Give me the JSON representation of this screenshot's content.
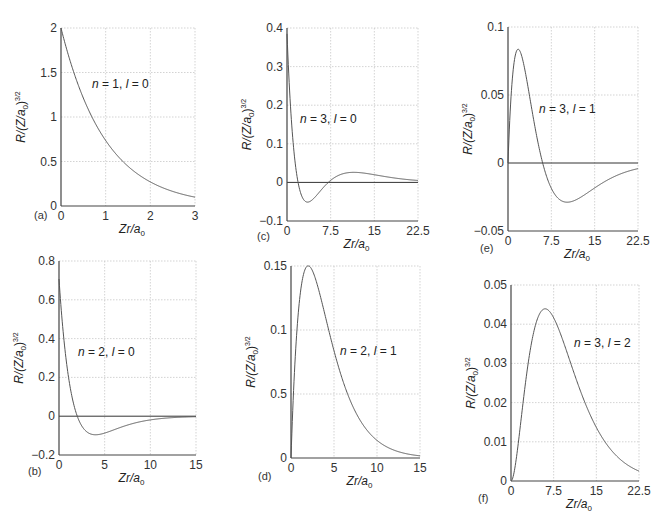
{
  "figure": {
    "ylabel_text": "R/(Z/a",
    "ylabel_sub": "0",
    "ylabel_sup": ")",
    "ylabel_exp": "3/2",
    "xlabel_text": "Zr/a",
    "xlabel_sub": "0"
  },
  "chart_data": [
    {
      "id": "a",
      "type": "line",
      "panel_label": "(a)",
      "annotation": "n = 1, l = 0",
      "n": 1,
      "l": 0,
      "xlabel": "Zr/a0",
      "ylabel": "R/(Z/a0)^(3/2)",
      "xlim": [
        0,
        3
      ],
      "ylim": [
        0,
        2
      ],
      "xticks": [
        "0",
        "1",
        "2",
        "3"
      ],
      "xtick_values": [
        0,
        1,
        2,
        3
      ],
      "yticks": [
        "0",
        "0.5",
        "1",
        "1.5",
        "2"
      ],
      "ytick_values": [
        0,
        0.5,
        1,
        1.5,
        2
      ],
      "grid": true,
      "series": [
        {
          "name": "R10",
          "x": [
            0,
            0.5,
            1,
            1.5,
            2,
            2.5,
            3
          ],
          "values": [
            2.0,
            1.21,
            0.74,
            0.45,
            0.27,
            0.16,
            0.1
          ]
        }
      ],
      "box": {
        "x0": 61,
        "y0": 28,
        "x1": 195,
        "y1": 206
      }
    },
    {
      "id": "b",
      "type": "line",
      "panel_label": "(b)",
      "annotation": "n = 2, l = 0",
      "n": 2,
      "l": 0,
      "xlabel": "Zr/a0",
      "ylabel": "R/(Z/a0)^(3/2)",
      "xlim": [
        0,
        15
      ],
      "ylim": [
        -0.2,
        0.8
      ],
      "xticks": [
        "0",
        "5",
        "10",
        "15"
      ],
      "xtick_values": [
        0,
        5,
        10,
        15
      ],
      "yticks": [
        "−0.2",
        "0",
        "0.2",
        "0.4",
        "0.6",
        "0.8"
      ],
      "ytick_values": [
        -0.2,
        0,
        0.2,
        0.4,
        0.6,
        0.8
      ],
      "grid": true,
      "series": [
        {
          "name": "R20",
          "x": [
            0,
            1,
            2,
            3,
            4,
            5,
            7.5,
            10,
            15
          ],
          "values": [
            0.707,
            0.214,
            0,
            -0.079,
            -0.096,
            -0.091,
            -0.057,
            -0.027,
            -0.003
          ]
        }
      ],
      "box": {
        "x0": 59,
        "y0": 261,
        "x1": 196,
        "y1": 455
      }
    },
    {
      "id": "c",
      "type": "line",
      "panel_label": "(c)",
      "annotation": "n = 3, l = 0",
      "n": 3,
      "l": 0,
      "xlabel": "Zr/a0",
      "ylabel": "R/(Z/a0)^(3/2)",
      "xlim": [
        0,
        22.5
      ],
      "ylim": [
        -0.1,
        0.4
      ],
      "xticks": [
        "0",
        "7.5",
        "15",
        "22.5"
      ],
      "xtick_values": [
        0,
        7.5,
        15,
        22.5
      ],
      "yticks": [
        "−0.1",
        "0",
        "0.1",
        "0.2",
        "0.3",
        "0.4"
      ],
      "ytick_values": [
        -0.1,
        0,
        0.1,
        0.2,
        0.3,
        0.4
      ],
      "grid": true,
      "series": [
        {
          "name": "R30",
          "x": [
            0,
            1.9,
            3.5,
            7.1,
            10.5,
            15,
            22.5
          ],
          "values": [
            0.385,
            0,
            -0.054,
            0,
            0.025,
            0.018,
            0.006
          ]
        }
      ],
      "box": {
        "x0": 287,
        "y0": 28,
        "x1": 418,
        "y1": 221
      }
    },
    {
      "id": "d",
      "type": "line",
      "panel_label": "(d)",
      "annotation": "n = 2, l = 1",
      "n": 2,
      "l": 1,
      "xlabel": "Zr/a0",
      "ylabel": "R/(Z/a0)^(3/2)",
      "xlim": [
        0,
        15
      ],
      "ylim": [
        0,
        0.15
      ],
      "xticks": [
        "0",
        "5",
        "10",
        "15"
      ],
      "xtick_values": [
        0,
        5,
        10,
        15
      ],
      "yticks": [
        "0",
        "0.5",
        "0.1",
        "0.15"
      ],
      "ytick_values": [
        0,
        0.05,
        0.1,
        0.15
      ],
      "grid": true,
      "series": [
        {
          "name": "R21",
          "x": [
            0,
            1,
            2,
            3,
            5,
            7.5,
            10,
            15
          ],
          "values": [
            0,
            0.124,
            0.15,
            0.137,
            0.084,
            0.036,
            0.014,
            0.002
          ]
        }
      ],
      "box": {
        "x0": 291,
        "y0": 266,
        "x1": 420,
        "y1": 458
      }
    },
    {
      "id": "e",
      "type": "line",
      "panel_label": "(e)",
      "annotation": "n = 3, l = 1",
      "n": 3,
      "l": 1,
      "xlabel": "Zr/a0",
      "ylabel": "R/(Z/a0)^(3/2)",
      "xlim": [
        0,
        22.5
      ],
      "ylim": [
        -0.05,
        0.1
      ],
      "xticks": [
        "0",
        "7.5",
        "15",
        "22.5"
      ],
      "xtick_values": [
        0,
        7.5,
        15,
        22.5
      ],
      "yticks": [
        "−0.05",
        "0",
        "0.05",
        "0.1"
      ],
      "ytick_values": [
        -0.05,
        0,
        0.05,
        0.1
      ],
      "grid": true,
      "series": [
        {
          "name": "R31",
          "x": [
            0,
            1.76,
            4,
            6,
            10.2,
            15,
            22.5
          ],
          "values": [
            0,
            0.075,
            0.041,
            0,
            -0.022,
            -0.012,
            -0.002
          ]
        }
      ],
      "box": {
        "x0": 508,
        "y0": 27,
        "x1": 638,
        "y1": 231
      }
    },
    {
      "id": "f",
      "type": "line",
      "panel_label": "(f)",
      "annotation": "n = 3, l = 2",
      "n": 3,
      "l": 2,
      "xlabel": "Zr/a0",
      "ylabel": "R/(Z/a0)^(3/2)",
      "xlim": [
        0,
        22.5
      ],
      "ylim": [
        0,
        0.05
      ],
      "xticks": [
        "0",
        "7.5",
        "15",
        "22.5"
      ],
      "xtick_values": [
        0,
        7.5,
        15,
        22.5
      ],
      "yticks": [
        "0",
        "0.01",
        "0.02",
        "0.03",
        "0.04",
        "0.05"
      ],
      "ytick_values": [
        0,
        0.01,
        0.02,
        0.03,
        0.04,
        0.05
      ],
      "grid": true,
      "series": [
        {
          "name": "R32",
          "x": [
            0,
            3,
            6,
            7.5,
            10,
            15,
            22.5
          ],
          "values": [
            0,
            0.029,
            0.045,
            0.044,
            0.036,
            0.015,
            0.003
          ]
        }
      ],
      "box": {
        "x0": 511,
        "y0": 285,
        "x1": 639,
        "y1": 481
      }
    }
  ],
  "annotation_positions": {
    "a": {
      "x": 92,
      "y": 88
    },
    "b": {
      "x": 78,
      "y": 356
    },
    "c": {
      "x": 300,
      "y": 123
    },
    "d": {
      "x": 340,
      "y": 355
    },
    "e": {
      "x": 539,
      "y": 113
    },
    "f": {
      "x": 574,
      "y": 347
    }
  },
  "panel_label_positions": {
    "a": {
      "x": 34,
      "y": 219
    },
    "b": {
      "x": 28,
      "y": 475
    },
    "c": {
      "x": 257,
      "y": 240
    },
    "d": {
      "x": 258,
      "y": 480
    },
    "e": {
      "x": 480,
      "y": 252
    },
    "f": {
      "x": 478,
      "y": 502
    }
  }
}
